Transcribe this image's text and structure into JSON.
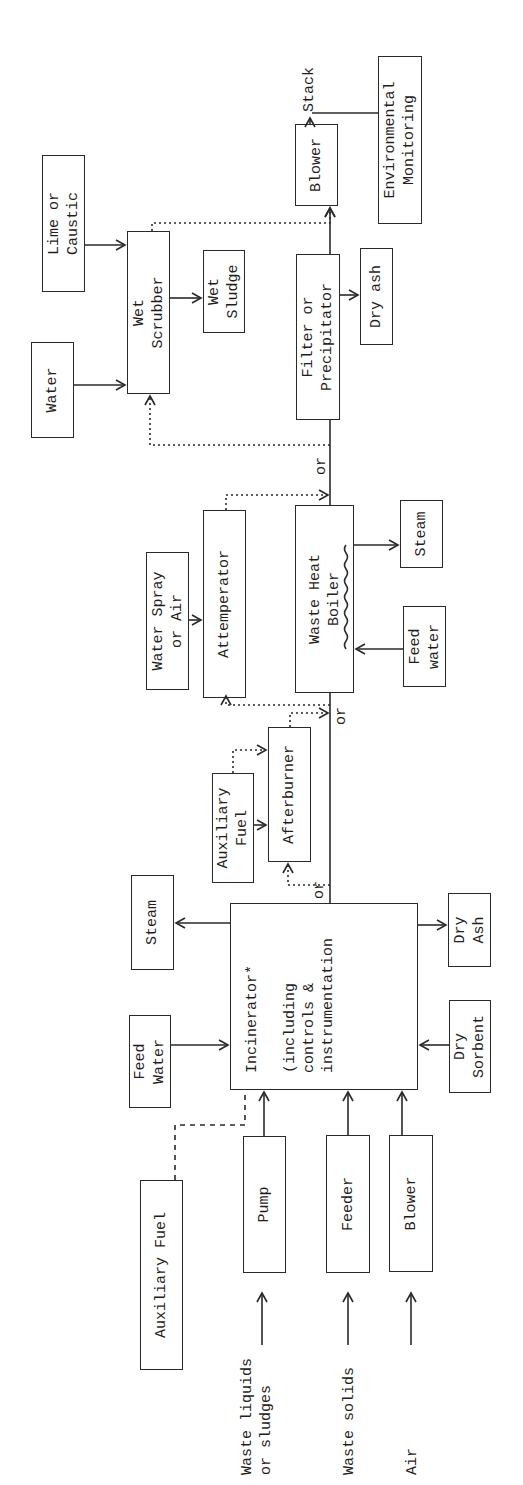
{
  "diagram": {
    "type": "process-flow",
    "orientation": "rotated-90-ccw",
    "boxes": {
      "auxiliary_fuel_main": "Auxiliary Fuel",
      "pump": "Pump",
      "feeder": "Feeder",
      "blower_air": "Blower",
      "feed_water_incinerator": "Feed\nWater",
      "steam_incinerator": "Steam",
      "incinerator": "Incinerator*\n\n(including\ncontrols &\ninstrumentation",
      "dry_sorbent": "Dry\nSorbent",
      "dry_ash_incinerator": "Dry\nAsh",
      "auxiliary_fuel_afterburner": "Auxiliary\nFuel",
      "afterburner": "Afterburner",
      "water_spray": "Water Spray\nor Air",
      "attemperator": "Attemperator",
      "waste_heat_boiler": "Waste Heat\nBoiler",
      "feed_water_boiler": "Feed\nwater",
      "steam_boiler": "Steam",
      "water": "Water",
      "lime_caustic": "Lime or\nCaustic",
      "wet_scrubber": "Wet\nScrubber",
      "wet_sludge": "Wet\nSludge",
      "filter_precipitator": "Filter or\nPrecipitator",
      "dry_ash_filter": "Dry ash",
      "blower_stack": "Blower",
      "environmental_monitoring": "Environmental\nMonitoring"
    },
    "labels": {
      "waste_liquids": "Waste liquids\nor sludges",
      "waste_solids": "Waste solids",
      "air": "Air",
      "stack": "Stack",
      "or_1": "or",
      "or_2": "or",
      "or_3": "or"
    },
    "connections": [
      {
        "from": "Waste liquids or sludges",
        "to": "Pump"
      },
      {
        "from": "Waste solids",
        "to": "Feeder"
      },
      {
        "from": "Air",
        "to": "Blower"
      },
      {
        "from": "Pump",
        "to": "Incinerator"
      },
      {
        "from": "Feeder",
        "to": "Incinerator"
      },
      {
        "from": "Blower",
        "to": "Incinerator"
      },
      {
        "from": "Auxiliary Fuel",
        "to": "Incinerator",
        "style": "dashed"
      },
      {
        "from": "Feed Water",
        "to": "Incinerator"
      },
      {
        "from": "Incinerator",
        "to": "Steam"
      },
      {
        "from": "Dry Sorbent",
        "to": "Incinerator"
      },
      {
        "from": "Incinerator",
        "to": "Dry Ash"
      },
      {
        "from": "Incinerator",
        "to": "Afterburner",
        "style": "optional"
      },
      {
        "from": "Auxiliary Fuel",
        "to": "Afterburner"
      },
      {
        "from": "Afterburner",
        "to": "Waste Heat Boiler",
        "style": "optional"
      },
      {
        "from": "Incinerator",
        "to": "Waste Heat Boiler"
      },
      {
        "from": "Incinerator",
        "to": "Attemperator",
        "style": "optional"
      },
      {
        "from": "Water Spray or Air",
        "to": "Attemperator"
      },
      {
        "from": "Feed water",
        "to": "Waste Heat Boiler"
      },
      {
        "from": "Waste Heat Boiler",
        "to": "Steam"
      },
      {
        "from": "Attemperator",
        "to": "Filter or Precipitator",
        "style": "optional"
      },
      {
        "from": "Waste Heat Boiler",
        "to": "Filter or Precipitator"
      },
      {
        "from": "Waste Heat Boiler",
        "to": "Wet Scrubber",
        "style": "optional"
      },
      {
        "from": "Water",
        "to": "Wet Scrubber"
      },
      {
        "from": "Lime or Caustic",
        "to": "Wet Scrubber"
      },
      {
        "from": "Wet Scrubber",
        "to": "Wet Sludge"
      },
      {
        "from": "Wet Scrubber",
        "to": "Blower",
        "style": "optional"
      },
      {
        "from": "Filter or Precipitator",
        "to": "Dry ash"
      },
      {
        "from": "Filter or Precipitator",
        "to": "Blower"
      },
      {
        "from": "Blower",
        "to": "Stack"
      },
      {
        "from": "Environmental Monitoring",
        "to": "Stack"
      }
    ]
  }
}
